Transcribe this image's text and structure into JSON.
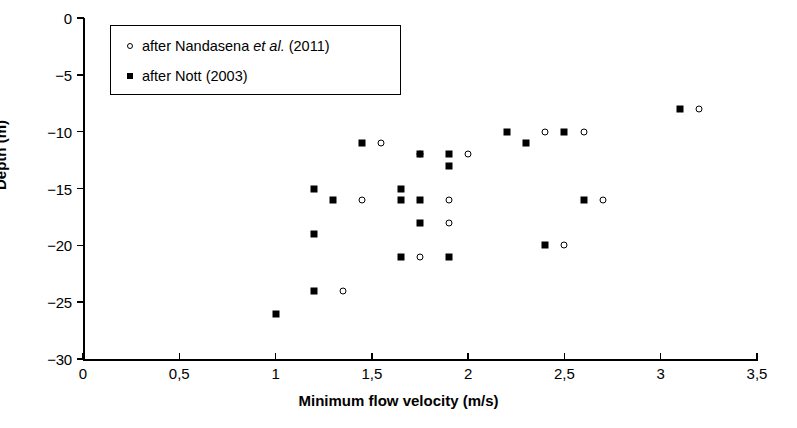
{
  "chart_data": {
    "type": "scatter",
    "title": "",
    "xlabel": "Minimum flow velocity (m/s)",
    "ylabel": "Depth (m)",
    "xlim": [
      0,
      3.5
    ],
    "ylim": [
      -30,
      0
    ],
    "xticks": [
      0,
      0.5,
      1,
      1.5,
      2,
      2.5,
      3,
      3.5
    ],
    "xticklabels": [
      "0",
      "0,5",
      "1",
      "1,5",
      "2",
      "2,5",
      "3",
      "3,5"
    ],
    "yticks": [
      0,
      -5,
      -10,
      -15,
      -20,
      -25,
      -30
    ],
    "yticklabels": [
      "0",
      "−5",
      "−10",
      "−15",
      "−20",
      "−25",
      "−30"
    ],
    "grid": false,
    "legend_position": "upper-left",
    "series": [
      {
        "name": "after Nandasena et al. (2011)",
        "marker": "open-circle",
        "color": "#000000",
        "points": [
          {
            "x": 3.2,
            "y": -8
          },
          {
            "x": 2.4,
            "y": -10
          },
          {
            "x": 2.6,
            "y": -10
          },
          {
            "x": 1.55,
            "y": -11
          },
          {
            "x": 2.0,
            "y": -12
          },
          {
            "x": 1.75,
            "y": -12
          },
          {
            "x": 1.45,
            "y": -16
          },
          {
            "x": 1.9,
            "y": -16
          },
          {
            "x": 2.7,
            "y": -16
          },
          {
            "x": 1.9,
            "y": -18
          },
          {
            "x": 2.5,
            "y": -20
          },
          {
            "x": 1.75,
            "y": -21
          },
          {
            "x": 1.35,
            "y": -24
          }
        ]
      },
      {
        "name": "after Nott (2003)",
        "marker": "filled-square",
        "color": "#000000",
        "points": [
          {
            "x": 3.1,
            "y": -8
          },
          {
            "x": 2.2,
            "y": -10
          },
          {
            "x": 2.5,
            "y": -10
          },
          {
            "x": 1.45,
            "y": -11
          },
          {
            "x": 2.3,
            "y": -11
          },
          {
            "x": 1.75,
            "y": -12
          },
          {
            "x": 1.9,
            "y": -12
          },
          {
            "x": 1.9,
            "y": -13
          },
          {
            "x": 1.2,
            "y": -15
          },
          {
            "x": 1.65,
            "y": -15
          },
          {
            "x": 1.3,
            "y": -16
          },
          {
            "x": 1.65,
            "y": -16
          },
          {
            "x": 1.75,
            "y": -16
          },
          {
            "x": 2.6,
            "y": -16
          },
          {
            "x": 1.75,
            "y": -18
          },
          {
            "x": 1.2,
            "y": -19
          },
          {
            "x": 2.4,
            "y": -20
          },
          {
            "x": 1.65,
            "y": -21
          },
          {
            "x": 1.9,
            "y": -21
          },
          {
            "x": 1.2,
            "y": -24
          },
          {
            "x": 1.0,
            "y": -26
          }
        ]
      }
    ]
  },
  "legend": {
    "entries": [
      {
        "prefix": "after Nandasena ",
        "italic": "et al.",
        "suffix": " (2011)",
        "marker": "open-circle"
      },
      {
        "prefix": "after Nott (2003)",
        "italic": "",
        "suffix": "",
        "marker": "filled-square"
      }
    ]
  }
}
